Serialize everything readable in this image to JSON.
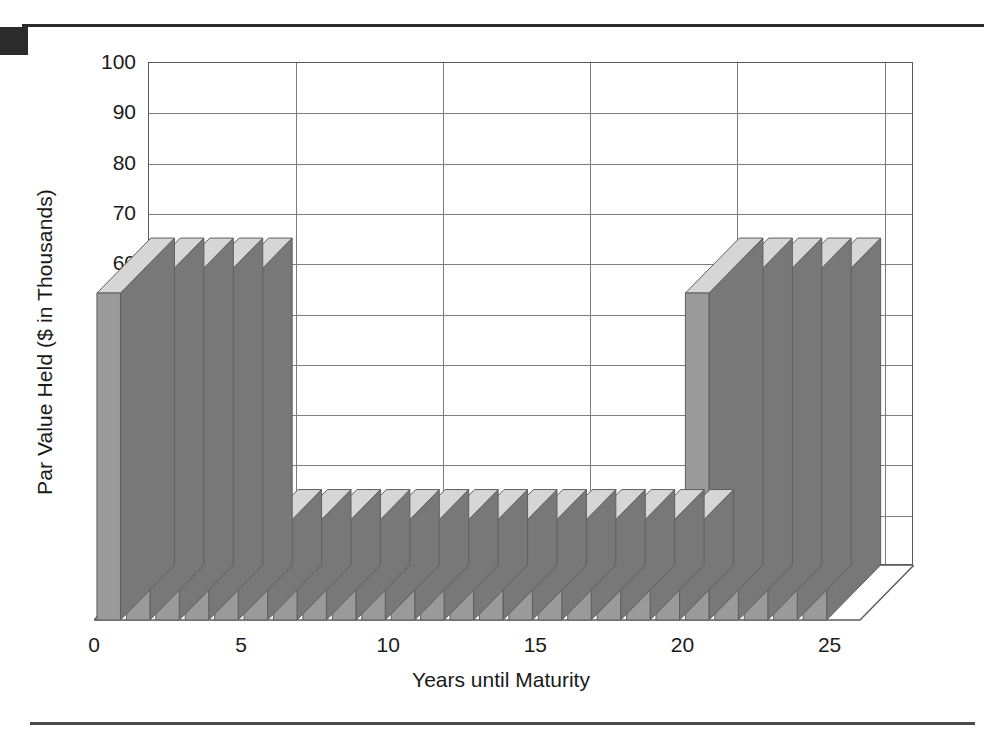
{
  "figure": {
    "corner_mark": "black-corner-square",
    "top_rule": "horizontal-rule",
    "bottom_rule": "horizontal-rule"
  },
  "chart_data": {
    "type": "bar",
    "title": "",
    "subtitle": "",
    "xlabel": "Years until Maturity",
    "ylabel": "Par Value Held ($ in Thousands)",
    "xlim": [
      0,
      26
    ],
    "ylim": [
      0,
      100
    ],
    "grid": true,
    "legend": "none",
    "style": "3d-column",
    "yticks": [
      100,
      90,
      80,
      70,
      60,
      50,
      40,
      30,
      20,
      10,
      0
    ],
    "ytick_labels": [
      "100",
      "90",
      "80",
      "70",
      "60",
      "50",
      "40",
      "30",
      "20",
      "10",
      "0"
    ],
    "xticks": [
      0,
      5,
      10,
      15,
      20,
      25
    ],
    "xtick_labels": [
      "0",
      "5",
      "10",
      "15",
      "20",
      "25"
    ],
    "x": [
      1,
      2,
      3,
      4,
      5,
      6,
      7,
      8,
      9,
      10,
      11,
      12,
      13,
      14,
      15,
      16,
      17,
      18,
      19,
      20,
      21,
      22,
      23,
      24,
      25
    ],
    "values": [
      65,
      65,
      65,
      65,
      65,
      15,
      15,
      15,
      15,
      15,
      15,
      15,
      15,
      15,
      15,
      15,
      15,
      15,
      15,
      15,
      65,
      65,
      65,
      65,
      65
    ],
    "categories": [
      "1",
      "2",
      "3",
      "4",
      "5",
      "6",
      "7",
      "8",
      "9",
      "10",
      "11",
      "12",
      "13",
      "14",
      "15",
      "16",
      "17",
      "18",
      "19",
      "20",
      "21",
      "22",
      "23",
      "24",
      "25"
    ],
    "colors": {
      "bar_front": "#9a9a9a",
      "bar_side": "#787878",
      "bar_top": "#d6d6d6",
      "axis": "#5a5a5a",
      "grid": "#7d7d7d",
      "text": "#1a1a1a",
      "rule": "#2b2b2b"
    },
    "annotations": [
      "Barbell maturity distribution: tall holdings at 1-5 years and 21-25 years, low holdings at 6-20 years."
    ]
  }
}
